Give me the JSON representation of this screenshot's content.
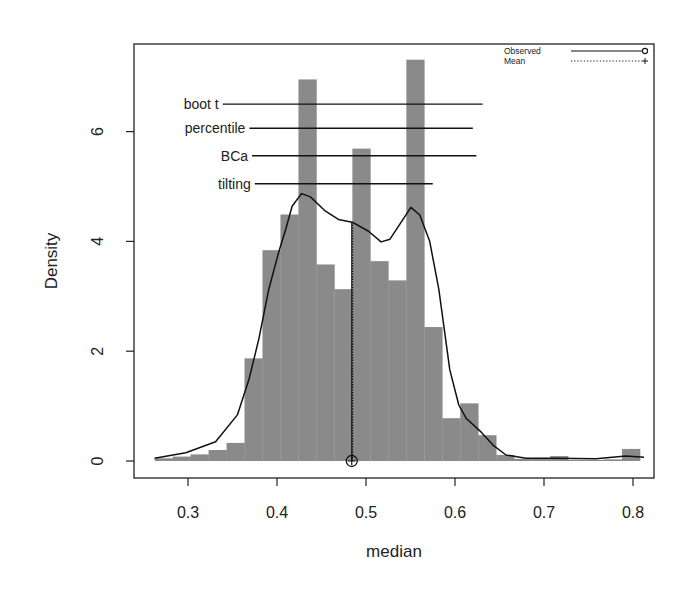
{
  "chart_data": {
    "type": "histogram",
    "title": "",
    "xlabel": "median",
    "ylabel": "Density",
    "xlim": [
      0.26,
      0.81
    ],
    "ylim": [
      0,
      7.3
    ],
    "x_ticks": [
      0.3,
      0.4,
      0.5,
      0.6,
      0.7,
      0.8
    ],
    "x_tick_labels": [
      "0.3",
      "0.4",
      "0.5",
      "0.6",
      "0.7",
      "0.8"
    ],
    "y_ticks": [
      0,
      2,
      4,
      6
    ],
    "y_tick_labels": [
      "0",
      "2",
      "4",
      "6"
    ],
    "grid": false,
    "bin_width": 0.0202,
    "bins": [
      {
        "start": 0.2625,
        "density": 0.05
      },
      {
        "start": 0.2827,
        "density": 0.08
      },
      {
        "start": 0.3029,
        "density": 0.12
      },
      {
        "start": 0.3231,
        "density": 0.2
      },
      {
        "start": 0.3433,
        "density": 0.33
      },
      {
        "start": 0.3635,
        "density": 1.87
      },
      {
        "start": 0.3837,
        "density": 3.84
      },
      {
        "start": 0.4039,
        "density": 4.49
      },
      {
        "start": 0.4241,
        "density": 6.95
      },
      {
        "start": 0.4443,
        "density": 3.58
      },
      {
        "start": 0.4645,
        "density": 3.13
      },
      {
        "start": 0.4847,
        "density": 5.69
      },
      {
        "start": 0.5049,
        "density": 3.64
      },
      {
        "start": 0.5251,
        "density": 3.29
      },
      {
        "start": 0.5453,
        "density": 7.31
      },
      {
        "start": 0.5655,
        "density": 2.44
      },
      {
        "start": 0.5857,
        "density": 0.78
      },
      {
        "start": 0.6059,
        "density": 1.05
      },
      {
        "start": 0.6261,
        "density": 0.47
      },
      {
        "start": 0.6463,
        "density": 0.11
      },
      {
        "start": 0.6665,
        "density": 0.04
      },
      {
        "start": 0.6867,
        "density": 0.04
      },
      {
        "start": 0.7069,
        "density": 0.09
      },
      {
        "start": 0.7271,
        "density": 0.02
      },
      {
        "start": 0.7473,
        "density": 0.02
      },
      {
        "start": 0.7675,
        "density": 0.03
      },
      {
        "start": 0.7877,
        "density": 0.22
      }
    ],
    "density_curve": {
      "x": [
        0.2625,
        0.2975,
        0.331,
        0.3555,
        0.3685,
        0.3795,
        0.3908,
        0.402,
        0.41,
        0.417,
        0.4275,
        0.4375,
        0.4545,
        0.469,
        0.4845,
        0.5025,
        0.517,
        0.527,
        0.5505,
        0.5605,
        0.5715,
        0.5818,
        0.5942,
        0.6043,
        0.6125,
        0.6292,
        0.6427,
        0.6573,
        0.6798,
        0.7135,
        0.7584,
        0.7921,
        0.8124
      ],
      "y": [
        0.05,
        0.15,
        0.35,
        0.84,
        1.49,
        2.22,
        3.13,
        3.81,
        4.23,
        4.64,
        4.87,
        4.81,
        4.55,
        4.4,
        4.35,
        4.19,
        3.99,
        4.04,
        4.62,
        4.48,
        4.01,
        3.13,
        1.66,
        1.02,
        0.78,
        0.53,
        0.29,
        0.11,
        0.05,
        0.05,
        0.04,
        0.09,
        0.07
      ]
    },
    "observed": {
      "value": 0.484,
      "label": "Observed",
      "marker": "circle",
      "line_style": "solid"
    },
    "mean": {
      "value": 0.484,
      "label": "Mean",
      "marker": "plus",
      "line_style": "dotted"
    },
    "vertical_line_top": 4.35,
    "confidence_intervals": [
      {
        "label": "boot t",
        "lower": 0.339,
        "upper": 0.631,
        "y_level": 6.5
      },
      {
        "label": "percentile",
        "lower": 0.369,
        "upper": 0.62,
        "y_level": 6.06
      },
      {
        "label": "BCa",
        "lower": 0.372,
        "upper": 0.624,
        "y_level": 5.56
      },
      {
        "label": "tilting",
        "lower": 0.375,
        "upper": 0.575,
        "y_level": 5.05
      }
    ],
    "legend": {
      "position": "top-right",
      "entries": [
        {
          "label": "Observed",
          "line_style": "solid",
          "marker": "circle"
        },
        {
          "label": "Mean",
          "line_style": "dotted",
          "marker": "plus"
        }
      ]
    },
    "colors": {
      "bars": "#8a8a8a",
      "curve": "#111111",
      "axes": "#222222",
      "background": "#ffffff"
    }
  }
}
